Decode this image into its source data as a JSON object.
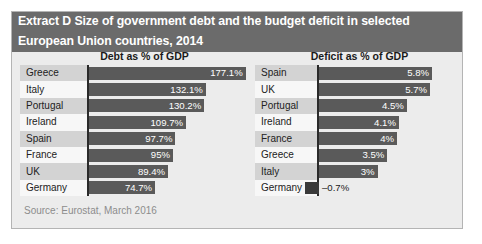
{
  "title": {
    "line1": "Extract D Size of government debt and the budget deficit in selected",
    "line2": "European Union countries, 2014"
  },
  "source": "Source: Eurostat, March 2016",
  "colors": {
    "banner": "#6b6b6b",
    "bar": "#5a5a5a",
    "negative_bar": "#3a3a3a",
    "panel_background": "#ececec",
    "label_stripe": "#d3d3d3",
    "axis": "#2a2a2a"
  },
  "chart_data": [
    {
      "type": "bar",
      "orientation": "horizontal",
      "title": "Debt as % of GDP",
      "xlabel": "",
      "ylabel": "",
      "xlim": [
        0,
        185
      ],
      "grid": false,
      "legend": false,
      "categories": [
        "Greece",
        "Italy",
        "Portugal",
        "Ireland",
        "Spain",
        "France",
        "UK",
        "Germany"
      ],
      "values": [
        177.1,
        132.1,
        130.2,
        109.7,
        97.7,
        95,
        89.4,
        74.7
      ],
      "value_labels": [
        "177.1%",
        "132.1%",
        "130.2%",
        "109.7%",
        "97.7%",
        "95%",
        "89.4%",
        "74.7%"
      ]
    },
    {
      "type": "bar",
      "orientation": "horizontal",
      "title": "Deficit as % of GDP",
      "xlabel": "",
      "ylabel": "",
      "xlim": [
        -1,
        6.2
      ],
      "grid": false,
      "legend": false,
      "categories": [
        "Spain",
        "UK",
        "Portugal",
        "Ireland",
        "France",
        "Greece",
        "Italy",
        "Germany"
      ],
      "values": [
        5.8,
        5.7,
        4.5,
        4.1,
        4,
        3.5,
        3,
        -0.7
      ],
      "value_labels": [
        "5.8%",
        "5.7%",
        "4.5%",
        "4.1%",
        "4%",
        "3.5%",
        "3%",
        "–0.7%"
      ]
    }
  ]
}
